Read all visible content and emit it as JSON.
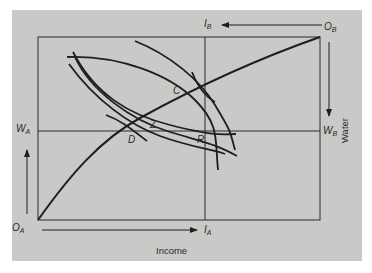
{
  "diagram": {
    "type": "edgeworth-box",
    "origins": {
      "a": {
        "main": "O",
        "sub": "A"
      },
      "b": {
        "main": "O",
        "sub": "B"
      }
    },
    "axis_labels": {
      "income_a": {
        "main": "I",
        "sub": "A"
      },
      "income_b": {
        "main": "I",
        "sub": "B"
      },
      "water_a": {
        "main": "W",
        "sub": "A"
      },
      "water_b": {
        "main": "W",
        "sub": "B"
      }
    },
    "axis_titles": {
      "x": "Income",
      "y": "Water"
    },
    "points": {
      "c": "C",
      "z": "Z",
      "d": "D",
      "r": "R"
    },
    "colors": {
      "background": "#c9c9c7",
      "ink": "#1e1e1e"
    }
  }
}
